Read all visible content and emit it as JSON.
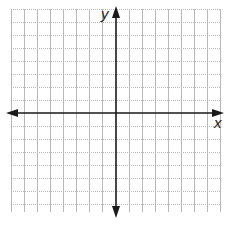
{
  "diagram": {
    "type": "coordinate-plane",
    "x_axis_label": "x",
    "y_axis_label": "y",
    "grid": {
      "spacing_px": 13,
      "vertical_lines_x": [
        11,
        24,
        37,
        50,
        63,
        76,
        89,
        102,
        129,
        142,
        155,
        168,
        181,
        194,
        207,
        220
      ],
      "horizontal_lines_y": [
        9,
        22,
        35,
        48,
        61,
        74,
        87,
        100,
        126,
        139,
        152,
        165,
        178,
        191,
        204
      ],
      "left": 11,
      "right": 220,
      "top": 9,
      "bottom": 212,
      "color": "#b8b8b8",
      "style": "dotted"
    },
    "origin": {
      "x": 116,
      "y": 113
    },
    "axis_color": "#1a1a1a",
    "x_axis": {
      "from": 6,
      "to": 224
    },
    "y_axis": {
      "from": 6,
      "to": 218
    }
  }
}
